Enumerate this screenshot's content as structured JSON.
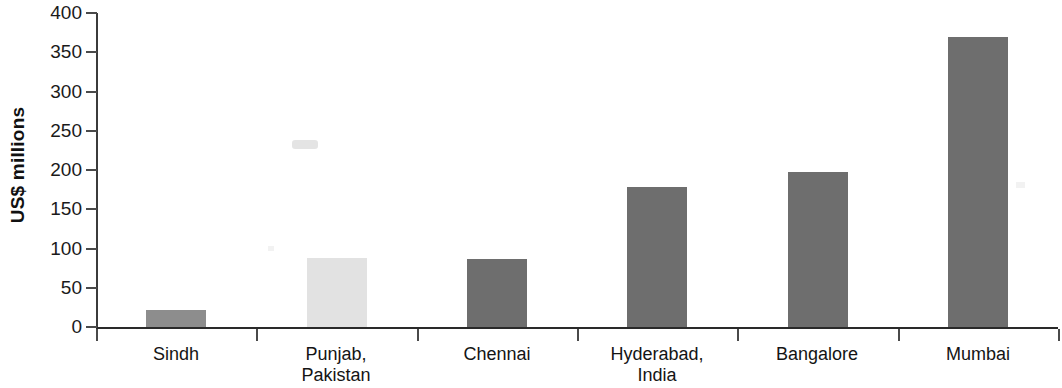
{
  "chart_data": {
    "type": "bar",
    "title": "",
    "subtitle": "",
    "xlabel": "",
    "ylabel": "US$ millions",
    "ylim": [
      0,
      400
    ],
    "yticks": [
      0,
      50,
      100,
      150,
      200,
      250,
      300,
      350,
      400
    ],
    "ytick_labels": [
      "0",
      "50",
      "100",
      "150",
      "200",
      "250",
      "300",
      "350",
      "400"
    ],
    "grid": false,
    "legend": "none",
    "categories": [
      "Sindh",
      "Punjab, Pakistan",
      "Chennai",
      "Hyderabad, India",
      "Bangalore",
      "Mumbai"
    ],
    "category_lines": [
      [
        "Sindh"
      ],
      [
        "Punjab,",
        "Pakistan"
      ],
      [
        "Chennai"
      ],
      [
        "Hyderabad,",
        "India"
      ],
      [
        "Bangalore"
      ],
      [
        "Mumbai"
      ]
    ],
    "values": [
      22,
      88,
      87,
      178,
      198,
      370
    ],
    "bar_colors": [
      "#8d8d8d",
      "#e2e2e2",
      "#6e6e6e",
      "#6e6e6e",
      "#6e6e6e",
      "#6e6e6e"
    ],
    "series": [
      {
        "name": "US$ millions",
        "values": [
          22,
          88,
          87,
          178,
          198,
          370
        ]
      }
    ]
  },
  "axis": {
    "y_title": "US$ millions"
  },
  "colors": {
    "bar_dark": "#6e6e6e",
    "bar_mid": "#8d8d8d",
    "bar_light": "#e2e2e2",
    "axis": "#2a2a2a",
    "text": "#141414",
    "background": "#ffffff"
  }
}
